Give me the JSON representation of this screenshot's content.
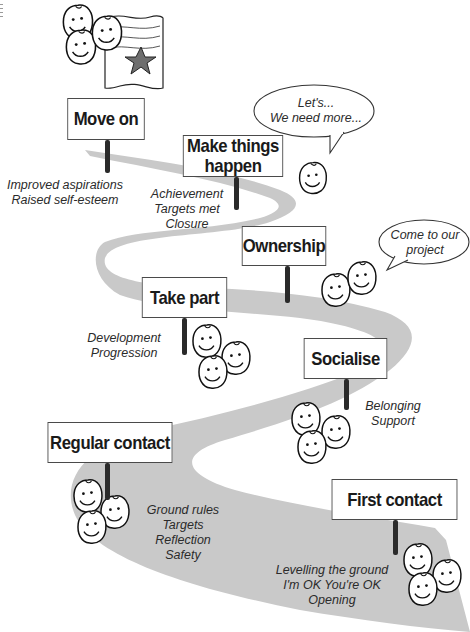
{
  "diagram": {
    "type": "journey-road",
    "road_color": "#c9c9c9",
    "stages": [
      {
        "id": "first-contact",
        "label": "First contact",
        "notes": "Levelling the ground\nI'm OK You're OK\nOpening"
      },
      {
        "id": "regular-contact",
        "label": "Regular contact",
        "notes": "Ground rules\nTargets\nReflection\nSafety"
      },
      {
        "id": "socialise",
        "label": "Socialise",
        "notes": "Belonging\nSupport"
      },
      {
        "id": "take-part",
        "label": "Take part",
        "notes": "Development\nProgression"
      },
      {
        "id": "ownership",
        "label": "Ownership",
        "notes": ""
      },
      {
        "id": "make-things-happen",
        "label": "Make things\nhappen",
        "notes": "Achievement\nTargets met\nClosure"
      },
      {
        "id": "move-on",
        "label": "Move on",
        "notes": "Improved aspirations\nRaised self-esteem"
      }
    ],
    "speech_bubbles": [
      {
        "id": "lets-bubble",
        "text": "Let's...\nWe need more..."
      },
      {
        "id": "come-bubble",
        "text": "Come to our\nproject"
      }
    ],
    "illustrations": {
      "flag_star_color": "#6e6e6e"
    }
  }
}
